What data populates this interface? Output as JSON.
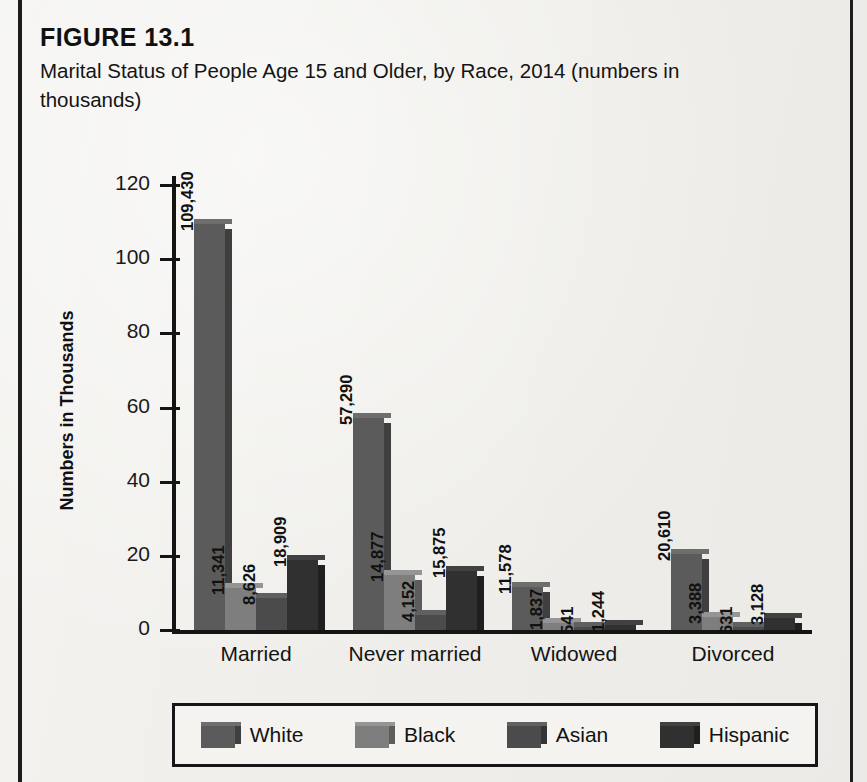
{
  "figure": {
    "label": "FIGURE 13.1",
    "caption": "Marital Status of People Age 15 and Older, by Race, 2014 (numbers in thousands)"
  },
  "chart_data": {
    "type": "bar",
    "title": "Marital Status of People Age 15 and Older, by Race, 2014 (numbers in thousands)",
    "xlabel": "",
    "ylabel": "Numbers in Thousands",
    "ylim": [
      0,
      130
    ],
    "yticks": [
      0,
      20,
      40,
      60,
      80,
      100,
      120
    ],
    "ytick_labels": [
      "0",
      "20",
      "40",
      "60",
      "80",
      "100",
      "120"
    ],
    "grid": false,
    "legend_position": "bottom",
    "value_label_units": "thousands",
    "categories": [
      "Married",
      "Never married",
      "Widowed",
      "Divorced"
    ],
    "series": [
      {
        "name": "White",
        "color": "#5b5b5b",
        "color_top": "#6e6e6e",
        "color_side": "#3f3f3f",
        "values": [
          109430,
          57290,
          11578,
          20610
        ],
        "labels": [
          "109,430",
          "57,290",
          "11,578",
          "20,610"
        ],
        "plot_values": [
          109.43,
          57.29,
          11.578,
          20.61
        ]
      },
      {
        "name": "Black",
        "color": "#7e7e7e",
        "color_top": "#959595",
        "color_side": "#5d5d5d",
        "values": [
          11341,
          14877,
          1837,
          3388
        ],
        "labels": [
          "11,341",
          "14,877",
          "1,837",
          "3,388"
        ],
        "plot_values": [
          11.341,
          14.877,
          1.837,
          3.388
        ]
      },
      {
        "name": "Asian",
        "color": "#4b4b4b",
        "color_top": "#606060",
        "color_side": "#343434",
        "values": [
          8626,
          4152,
          541,
          631
        ],
        "labels": [
          "8,626",
          "4,152",
          "541",
          "631"
        ],
        "plot_values": [
          8.626,
          4.152,
          0.541,
          0.631
        ]
      },
      {
        "name": "Hispanic",
        "color": "#303030",
        "color_top": "#414141",
        "color_side": "#1f1f1f",
        "values": [
          18909,
          15875,
          1244,
          3128
        ],
        "labels": [
          "18,909",
          "15,875",
          "1,244",
          "3,128"
        ],
        "plot_values": [
          18.909,
          15.875,
          1.244,
          3.128
        ]
      }
    ]
  },
  "legend": {
    "items": [
      {
        "label": "White"
      },
      {
        "label": "Black"
      },
      {
        "label": "Asian"
      },
      {
        "label": "Hispanic"
      }
    ]
  }
}
